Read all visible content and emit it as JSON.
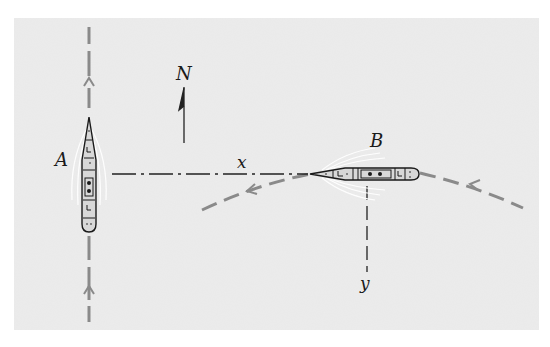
{
  "figure": {
    "background": "#ececec",
    "path_color": "#8a8a8a",
    "ink_color": "#1a1a1a",
    "labels": {
      "north": "N",
      "ship_a": "A",
      "ship_b": "B",
      "distance_x": "x",
      "distance_y": "y"
    },
    "ships": [
      {
        "name": "A",
        "heading": "north",
        "path": "straight vertical dashed line"
      },
      {
        "name": "B",
        "heading": "west",
        "path": "curved dashed arc"
      }
    ],
    "icons": [
      "north-arrow-icon",
      "ship-a-icon",
      "ship-b-icon",
      "path-arrowhead-icon"
    ]
  }
}
